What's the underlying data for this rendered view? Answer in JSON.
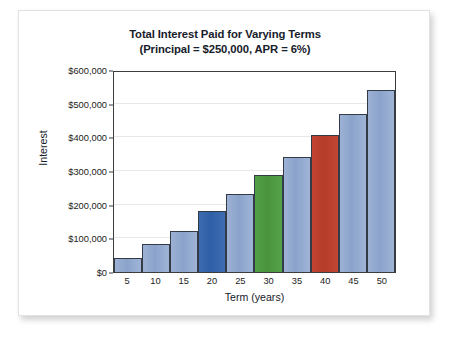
{
  "chart_data": {
    "type": "bar",
    "title": "Total Interest Paid for Varying Terms (Principal = $250,000, APR = 6%)",
    "title_lines": [
      "Total Interest Paid for Varying Terms",
      "(Principal = $250,000, APR = 6%)"
    ],
    "xlabel": "Term (years)",
    "ylabel": "Interest",
    "categories": [
      "5",
      "10",
      "15",
      "20",
      "25",
      "30",
      "35",
      "40",
      "45",
      "50"
    ],
    "values": [
      42000,
      84000,
      122000,
      182000,
      233000,
      287000,
      343000,
      406000,
      469000,
      540000
    ],
    "ylim": [
      0,
      600000
    ],
    "ytick_values": [
      0,
      100000,
      200000,
      300000,
      400000,
      500000,
      600000
    ],
    "ytick_labels": [
      "$0",
      "$100,000",
      "$200,000",
      "$300,000",
      "$400,000",
      "$500,000",
      "$600,000"
    ],
    "grid": true,
    "legend": "none",
    "bar_colors": [
      "light-blue",
      "light-blue",
      "light-blue",
      "dark-blue",
      "light-blue",
      "green",
      "light-blue",
      "red",
      "light-blue",
      "light-blue"
    ],
    "colors": {
      "light_blue": "#8ba3cb",
      "dark_blue": "#2f5fa6",
      "green": "#49933d",
      "red": "#b53c2a",
      "bar_outline": "#333b47",
      "axis": "#3d3d3d",
      "gridline": "#e8e8e8",
      "text": "#17202a",
      "card_background": "#ffffff",
      "card_border": "#e2e2e2"
    }
  }
}
